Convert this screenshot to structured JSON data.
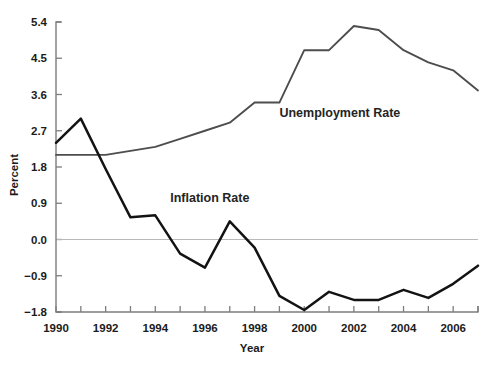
{
  "chart_data": {
    "type": "line",
    "title": "",
    "xlabel": "Year",
    "ylabel": "Percent",
    "x": [
      1990,
      1991,
      1992,
      1993,
      1994,
      1995,
      1996,
      1997,
      1998,
      1999,
      2000,
      2001,
      2002,
      2003,
      2004,
      2005,
      2006,
      2007
    ],
    "xlim": [
      1990,
      2007
    ],
    "ylim": [
      -1.8,
      5.4
    ],
    "yticks": [
      -1.8,
      -0.9,
      0.0,
      0.9,
      1.8,
      2.7,
      3.6,
      4.5,
      5.4
    ],
    "ytick_labels": [
      "−1.8",
      "−0.9",
      "0.0",
      "0.9",
      "1.8",
      "2.7",
      "3.6",
      "4.5",
      "5.4"
    ],
    "xticks": [
      1990,
      1991,
      1992,
      1993,
      1994,
      1995,
      1996,
      1997,
      1998,
      1999,
      2000,
      2001,
      2002,
      2003,
      2004,
      2005,
      2006,
      2007
    ],
    "xtick_labels": [
      "1990",
      "",
      "1992",
      "",
      "1994",
      "",
      "1996",
      "",
      "1998",
      "",
      "2000",
      "",
      "2002",
      "",
      "2004",
      "",
      "2006",
      ""
    ],
    "grid": false,
    "legend_position": "inline-annotation",
    "zero_reference_line": 0.0,
    "series": [
      {
        "name": "Unemployment Rate",
        "color": "#4d4d4d",
        "label_x": 1999.0,
        "label_y": 3.05,
        "values": [
          2.1,
          2.1,
          2.1,
          2.2,
          2.3,
          2.5,
          2.7,
          2.9,
          3.4,
          3.4,
          4.7,
          4.7,
          5.3,
          5.2,
          4.7,
          4.4,
          4.2,
          3.7
        ]
      },
      {
        "name": "Inflation Rate",
        "color": "#131313",
        "label_x": 1994.6,
        "label_y": 0.92,
        "values": [
          2.4,
          3.0,
          1.75,
          0.55,
          0.6,
          -0.35,
          -0.7,
          0.45,
          -0.2,
          -1.4,
          -1.75,
          -1.3,
          -1.5,
          -1.5,
          -1.25,
          -1.45,
          -1.1,
          -0.65
        ]
      }
    ]
  }
}
